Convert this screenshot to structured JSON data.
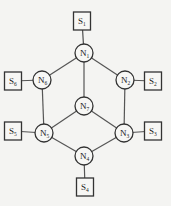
{
  "diagram": {
    "nodes": [
      {
        "id": "N1",
        "base": "N",
        "sub": "1",
        "cx": 84,
        "cy": 53
      },
      {
        "id": "N2",
        "base": "N",
        "sub": "2",
        "cx": 125,
        "cy": 80
      },
      {
        "id": "N3",
        "base": "N",
        "sub": "3",
        "cx": 124,
        "cy": 133
      },
      {
        "id": "N4",
        "base": "N",
        "sub": "4",
        "cx": 84,
        "cy": 156
      },
      {
        "id": "N5",
        "base": "N",
        "sub": "5",
        "cx": 44,
        "cy": 133
      },
      {
        "id": "N6",
        "base": "N",
        "sub": "6",
        "cx": 42,
        "cy": 80
      },
      {
        "id": "N7",
        "base": "N",
        "sub": "7",
        "cx": 84,
        "cy": 106
      }
    ],
    "sinks": [
      {
        "id": "S1",
        "base": "S",
        "sub": "1",
        "cx": 82,
        "cy": 21
      },
      {
        "id": "S2",
        "base": "S",
        "sub": "2",
        "cx": 153,
        "cy": 81
      },
      {
        "id": "S3",
        "base": "S",
        "sub": "3",
        "cx": 153,
        "cy": 131
      },
      {
        "id": "S4",
        "base": "S",
        "sub": "4",
        "cx": 85,
        "cy": 187
      },
      {
        "id": "S5",
        "base": "S",
        "sub": "5",
        "cx": 13,
        "cy": 131
      },
      {
        "id": "S6",
        "base": "S",
        "sub": "6",
        "cx": 13,
        "cy": 81
      }
    ],
    "edges": [
      [
        "S1",
        "N1"
      ],
      [
        "N1",
        "N6"
      ],
      [
        "N1",
        "N2"
      ],
      [
        "N1",
        "N7"
      ],
      [
        "N6",
        "S6"
      ],
      [
        "N2",
        "S2"
      ],
      [
        "N6",
        "N5"
      ],
      [
        "N2",
        "N3"
      ],
      [
        "N7",
        "N5"
      ],
      [
        "N7",
        "N3"
      ],
      [
        "N5",
        "S5"
      ],
      [
        "N3",
        "S3"
      ],
      [
        "N5",
        "N4"
      ],
      [
        "N3",
        "N4"
      ],
      [
        "N4",
        "S4"
      ]
    ]
  }
}
